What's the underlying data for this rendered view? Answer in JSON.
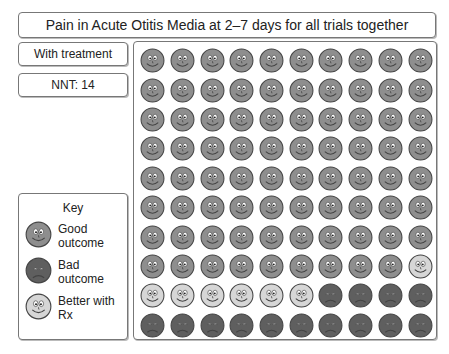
{
  "title": "Pain in Acute Otitis Media at 2–7 days for all trials together",
  "labels": {
    "treatment": "With treatment",
    "nnt": "NNT: 14"
  },
  "key": {
    "title": "Key",
    "items": [
      {
        "type": "good",
        "label": "Good outcome"
      },
      {
        "type": "bad",
        "label": "Bad outcome"
      },
      {
        "type": "better",
        "label": "Better with Rx"
      }
    ]
  },
  "colors": {
    "good": "#8e8e8e",
    "bad": "#5f5f5f",
    "better": "#d6d6d6",
    "outline": "#444444"
  },
  "grid": {
    "columns": 10,
    "rows": 10,
    "counts": {
      "good": 79,
      "better": 7,
      "bad": 14
    },
    "cells": [
      "good",
      "good",
      "good",
      "good",
      "good",
      "good",
      "good",
      "good",
      "good",
      "good",
      "good",
      "good",
      "good",
      "good",
      "good",
      "good",
      "good",
      "good",
      "good",
      "good",
      "good",
      "good",
      "good",
      "good",
      "good",
      "good",
      "good",
      "good",
      "good",
      "good",
      "good",
      "good",
      "good",
      "good",
      "good",
      "good",
      "good",
      "good",
      "good",
      "good",
      "good",
      "good",
      "good",
      "good",
      "good",
      "good",
      "good",
      "good",
      "good",
      "good",
      "good",
      "good",
      "good",
      "good",
      "good",
      "good",
      "good",
      "good",
      "good",
      "good",
      "good",
      "good",
      "good",
      "good",
      "good",
      "good",
      "good",
      "good",
      "good",
      "good",
      "good",
      "good",
      "good",
      "good",
      "good",
      "good",
      "good",
      "good",
      "good",
      "better",
      "better",
      "better",
      "better",
      "better",
      "better",
      "better",
      "bad",
      "bad",
      "bad",
      "bad",
      "bad",
      "bad",
      "bad",
      "bad",
      "bad",
      "bad",
      "bad",
      "bad",
      "bad",
      "bad"
    ]
  }
}
